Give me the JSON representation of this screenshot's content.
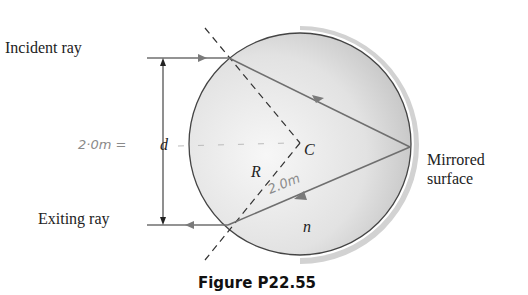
{
  "labels": {
    "incident_ray": "Incident ray",
    "exiting_ray": "Exiting ray",
    "mirrored_line1": "Mirrored",
    "mirrored_line2": "surface",
    "center": "C",
    "radius": "R",
    "index": "n",
    "distance": "d",
    "handwritten_d": "2·0m =",
    "handwritten_r": "2.0m"
  },
  "caption": "Figure P22.55",
  "colors": {
    "ray": "#6f6f6f",
    "outline": "#444444",
    "sphere_light": "#f4f4f4",
    "sphere_dark": "#c9c9c9",
    "mirror": "#cfcfcf",
    "handwriting": "#8a8a8a"
  }
}
